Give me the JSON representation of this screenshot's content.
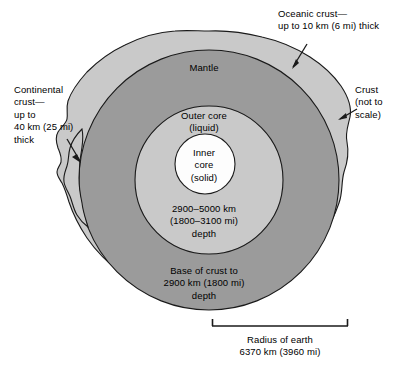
{
  "figure": {
    "type": "cross-section-diagram",
    "background_color": "#ffffff"
  },
  "layers": [
    {
      "name": "crust",
      "label": "Crust\n(not to\nscale)",
      "fill_color": "#c9c9c9",
      "outline_color": "#1a1a1a"
    },
    {
      "name": "mantle",
      "label": "Mantle",
      "fill_color": "#9b9b9b",
      "outline_color": "#1a1a1a",
      "depth_note": "Base of crust to\n2900 km (1800 mi)\ndepth"
    },
    {
      "name": "outer-core",
      "label": "Outer core\n(liquid)",
      "fill_color": "#c9c9c9",
      "outline_color": "#1a1a1a",
      "depth_note": "2900–5000 km\n(1800–3100 mi)\ndepth"
    },
    {
      "name": "inner-core",
      "label": "Inner\ncore\n(solid)",
      "fill_color": "#fdfdfd",
      "outline_color": "#1a1a1a"
    }
  ],
  "annotations": {
    "oceanic_crust": "Oceanic crust—\nup to 10 km (6 mi) thick",
    "continental_crust": "Continental\ncrust—\nup to\n40 km (25 mi)\nthick",
    "crust_not_to_scale": "Crust\n(not to\nscale)"
  },
  "interior_labels": {
    "mantle": "Mantle",
    "outer_core": "Outer core\n(liquid)",
    "inner_core": "Inner\ncore\n(solid)",
    "outer_core_depth": "2900–5000 km\n(1800–3100 mi)\ndepth",
    "mantle_depth": "Base of crust to\n2900 km (1800 mi)\ndepth"
  },
  "scale_bar": {
    "caption": "Radius of earth\n6370 km (3960 mi)",
    "value_km": 6370,
    "value_mi": 3960,
    "start_x": 212,
    "end_x": 348,
    "y": 326
  },
  "geometry": {
    "center_x": 209,
    "center_y": 180,
    "mantle_radius": 136,
    "outer_core_radius": 74,
    "inner_core_radius": 30
  }
}
